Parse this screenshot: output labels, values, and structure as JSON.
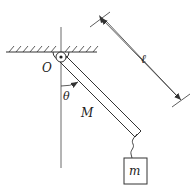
{
  "diagram": {
    "type": "physics-pendulum",
    "labels": {
      "pivot": "O",
      "angle": "θ",
      "rod_mass": "M",
      "length": "ℓ",
      "hanging_mass": "m"
    },
    "colors": {
      "stroke": "#333333",
      "background": "#ffffff"
    }
  }
}
